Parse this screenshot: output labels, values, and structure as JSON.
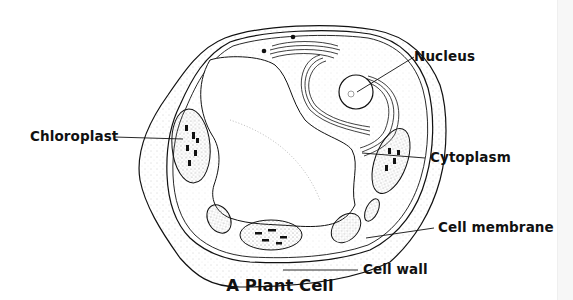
{
  "diagram": {
    "title": "A Plant Cell",
    "labels": {
      "nucleus": "Nucleus",
      "chloroplast": "Chloroplast",
      "cytoplasm": "Cytoplasm",
      "cell_membrane": "Cell membrane",
      "cell_wall": "Cell wall"
    },
    "colors": {
      "line": "#111111",
      "background": "#ffffff",
      "stipple": "#999999"
    }
  }
}
